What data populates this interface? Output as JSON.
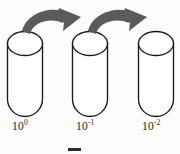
{
  "figure": {
    "type": "serial-dilution-diagram",
    "width": 180,
    "height": 154,
    "background_color": "#fdfdfd"
  },
  "colors": {
    "outline": "#1a1a1a",
    "arrow_gray": "#5b5b5b",
    "tube_fill": "#ffffff",
    "label_color": "#1c1c1c",
    "bottom_mark": "#2b2b2b"
  },
  "tubes": [
    {
      "id": "tube-1",
      "label_base": "10",
      "label_exponent": "0",
      "label_full": "10⁰",
      "x": 7,
      "top_y": 32,
      "width": 35,
      "height": 84
    },
    {
      "id": "tube-2",
      "label_base": "10",
      "label_exponent": "-1",
      "label_full": "10⁻¹",
      "x": 72,
      "top_y": 32,
      "width": 35,
      "height": 84
    },
    {
      "id": "tube-3",
      "label_base": "10",
      "label_exponent": "-2",
      "label_full": "10⁻²",
      "x": 138,
      "top_y": 32,
      "width": 35,
      "height": 84
    }
  ],
  "arrows": [
    {
      "id": "arrow-1",
      "from": "tube-1",
      "to": "tube-2",
      "icon": "curved-transfer-arrow-icon",
      "direction": "left-to-right"
    },
    {
      "id": "arrow-2",
      "from": "tube-2",
      "to": "tube-3",
      "icon": "curved-transfer-arrow-icon",
      "direction": "left-to-right"
    }
  ],
  "bottom_artifact": {
    "id": "bottom-mark",
    "x": 68,
    "y": 148,
    "width": 13,
    "height": 3
  }
}
